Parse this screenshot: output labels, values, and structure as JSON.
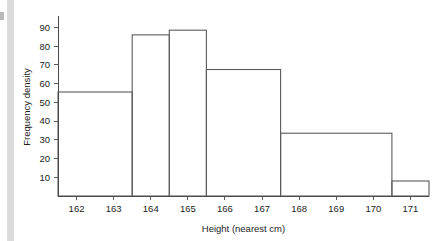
{
  "chart_data": {
    "type": "bar",
    "title": "",
    "xlabel": "Height (nearest cm)",
    "ylabel": "Frequency density",
    "xlim": [
      161.5,
      171.5
    ],
    "ylim": [
      0,
      95
    ],
    "grid": false,
    "legend": null,
    "bar_style": "histogram-outline-unfilled",
    "x_tick_labels": [
      "162",
      "163",
      "164",
      "165",
      "166",
      "167",
      "168",
      "169",
      "170",
      "171"
    ],
    "x_tick_values": [
      162,
      163,
      164,
      165,
      166,
      167,
      168,
      169,
      170,
      171
    ],
    "y_tick_labels": [
      "10",
      "20",
      "30",
      "40",
      "50",
      "60",
      "70",
      "80",
      "90"
    ],
    "y_tick_values": [
      10,
      20,
      30,
      40,
      50,
      60,
      70,
      80,
      90
    ],
    "bins": [
      {
        "label": "161.5-163.5",
        "start": 161.5,
        "end": 163.5,
        "value": 55.5
      },
      {
        "label": "163.5-164.5",
        "start": 163.5,
        "end": 164.5,
        "value": 86
      },
      {
        "label": "164.5-165.5",
        "start": 164.5,
        "end": 165.5,
        "value": 88.5
      },
      {
        "label": "165.5-167.5",
        "start": 165.5,
        "end": 167.5,
        "value": 67.5
      },
      {
        "label": "167.5-170.5",
        "start": 167.5,
        "end": 170.5,
        "value": 33.5
      },
      {
        "label": "170.5-171.5",
        "start": 170.5,
        "end": 171.5,
        "value": 8
      }
    ],
    "categories": [
      "161.5-163.5",
      "163.5-164.5",
      "164.5-165.5",
      "165.5-167.5",
      "167.5-170.5",
      "170.5-171.5"
    ],
    "values": [
      55.5,
      86,
      88.5,
      67.5,
      33.5,
      8
    ]
  },
  "colors": {
    "bar_outline": "#5b5b5b",
    "axis": "#4a4a4a",
    "text": "#1d1d1d",
    "background": "#ffffff",
    "edge_strip": "#dcdcdc"
  }
}
